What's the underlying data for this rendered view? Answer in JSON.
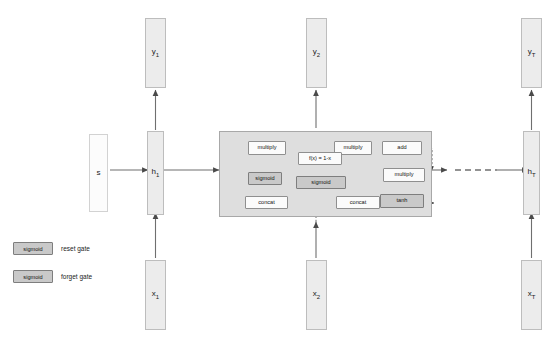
{
  "diagram": {
    "colors": {
      "cell_background": "#dedede",
      "bar_fill": "#ececec",
      "gate_fill": "#c9c9c9",
      "op_fill": "#fbfbfb",
      "stroke": "#6f6f6f"
    }
  },
  "top_strip": {
    "fragments": [
      "",
      "",
      "",
      "",
      ""
    ]
  },
  "timesteps": [
    {
      "id": "t1",
      "input_label": "x",
      "input_sub": "1",
      "hidden_label": "h",
      "hidden_sub": "1",
      "output_label": "y",
      "output_sub": "1"
    },
    {
      "id": "t2",
      "input_label": "x",
      "input_sub": "2",
      "hidden_label": "h",
      "hidden_sub": "2",
      "output_label": "y",
      "output_sub": "2"
    },
    {
      "id": "tT",
      "input_label": "x",
      "input_sub": "T",
      "hidden_label": "h",
      "hidden_sub": "T",
      "output_label": "y",
      "output_sub": "T"
    }
  ],
  "initial_state": {
    "label": "s"
  },
  "cell": {
    "name": "gru-cell",
    "ops": [
      {
        "id": "multiply-reset",
        "label": "multiply"
      },
      {
        "id": "sigmoid-reset",
        "label": "sigmoid"
      },
      {
        "id": "concat-left",
        "label": "concat"
      },
      {
        "id": "multiply-forget",
        "label": "multiply"
      },
      {
        "id": "invert",
        "label": "f(x) = 1-x"
      },
      {
        "id": "sigmoid-forget",
        "label": "sigmoid"
      },
      {
        "id": "concat-right",
        "label": "concat"
      },
      {
        "id": "add",
        "label": "add"
      },
      {
        "id": "multiply-candidate",
        "label": "multiply"
      },
      {
        "id": "tanh",
        "label": "tanh"
      }
    ]
  },
  "legend": [
    {
      "box_label": "sigmoid",
      "text": "reset gate"
    },
    {
      "box_label": "sigmoid",
      "text": "forget gate"
    }
  ],
  "ellipsis": {
    "label": "continues for remaining timesteps"
  }
}
